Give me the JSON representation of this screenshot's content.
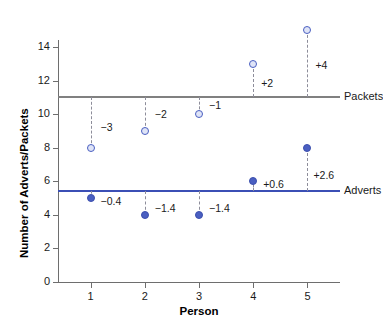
{
  "chart_data": {
    "type": "scatter",
    "title": "",
    "xlabel": "Person",
    "ylabel": "Number of Adverts/Packets",
    "categories": [
      "1",
      "2",
      "3",
      "4",
      "5"
    ],
    "x": [
      1,
      2,
      3,
      4,
      5
    ],
    "xlim": [
      0.4,
      5.6
    ],
    "ylim": [
      0,
      15.6
    ],
    "yticks": [
      "0",
      "2",
      "4",
      "6",
      "8",
      "10",
      "12",
      "14"
    ],
    "ytick_values": [
      0,
      2,
      4,
      6,
      8,
      10,
      12,
      14
    ],
    "grid": false,
    "legend_position": "right-inline",
    "series": [
      {
        "name": "Packets",
        "marker": "open-circle",
        "color": "#4a5fc1",
        "values": [
          8,
          9,
          10,
          13,
          15
        ],
        "deviation_labels": [
          "−3",
          "−2",
          "−1",
          "+2",
          "+4"
        ],
        "deviations": [
          -3,
          -2,
          -1,
          2,
          4
        ]
      },
      {
        "name": "Adverts",
        "marker": "filled-circle",
        "color": "#4a5fc1",
        "values": [
          5,
          4,
          4,
          6,
          8
        ],
        "deviation_labels": [
          "−0.4",
          "−1.4",
          "−1.4",
          "+0.6",
          "+2.6"
        ],
        "deviations": [
          -0.4,
          -1.4,
          -1.4,
          0.6,
          2.6
        ]
      }
    ],
    "reference_lines": [
      {
        "name": "Packets",
        "value": 11,
        "color": "#808080",
        "label": "Packets"
      },
      {
        "name": "Adverts",
        "value": 5.4,
        "color": "#3b4fb5",
        "label": "Adverts"
      }
    ],
    "annotations": {
      "packets_line_label": "Packets",
      "adverts_line_label": "Adverts"
    }
  }
}
